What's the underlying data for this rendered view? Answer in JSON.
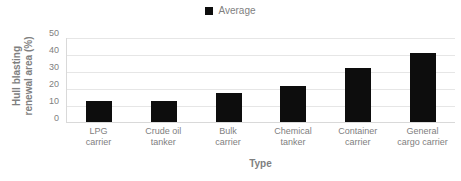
{
  "chart_data": {
    "type": "bar",
    "title": "",
    "xlabel": "Type",
    "ylabel": "Hull blasting renewal area (%)",
    "ylabel_line1": "Hull blasting",
    "ylabel_line2": "renewal area (%)",
    "categories": [
      "LPG carrier",
      "Crude oil tanker",
      "Bulk carrier",
      "Chemical tanker",
      "Container carrier",
      "General cargo carrier"
    ],
    "category_lines": [
      [
        "LPG",
        "carrier"
      ],
      [
        "Crude oil",
        "tanker"
      ],
      [
        "Bulk",
        "carrier"
      ],
      [
        "Chemical tanker"
      ],
      [
        "Container",
        "carrier"
      ],
      [
        "General",
        "cargo carrier"
      ]
    ],
    "series": [
      {
        "name": "Average",
        "values": [
          12.5,
          12.6,
          17.4,
          21.3,
          32.0,
          41.2
        ],
        "color": "#0d0d0d"
      }
    ],
    "ylim": [
      0,
      50
    ],
    "yticks": [
      0,
      10,
      20,
      30,
      40,
      50
    ],
    "ytick_labels": [
      "0",
      "10",
      "20",
      "30",
      "40",
      "50"
    ],
    "grid": true,
    "grid_color": "#e6e6e6",
    "legend": {
      "position": "top-center",
      "entries": [
        {
          "label": "Average",
          "marker": "square",
          "color": "#0d0d0d"
        }
      ]
    },
    "axis_color": "#d9d9d9",
    "text_color": "#808080",
    "background": "#ffffff"
  }
}
